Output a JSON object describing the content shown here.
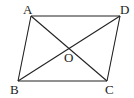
{
  "diagram": {
    "type": "parallelogram-with-diagonals",
    "points": {
      "A": {
        "label": "A",
        "x": 31,
        "y": 16
      },
      "D": {
        "label": "D",
        "x": 120,
        "y": 16
      },
      "B": {
        "label": "B",
        "x": 18,
        "y": 81
      },
      "C": {
        "label": "C",
        "x": 107,
        "y": 81
      },
      "O": {
        "label": "O",
        "x": 69,
        "y": 48
      }
    },
    "segments": [
      "AD",
      "DC",
      "CB",
      "BA",
      "AC",
      "BD"
    ],
    "stroke_color": "#222222"
  }
}
